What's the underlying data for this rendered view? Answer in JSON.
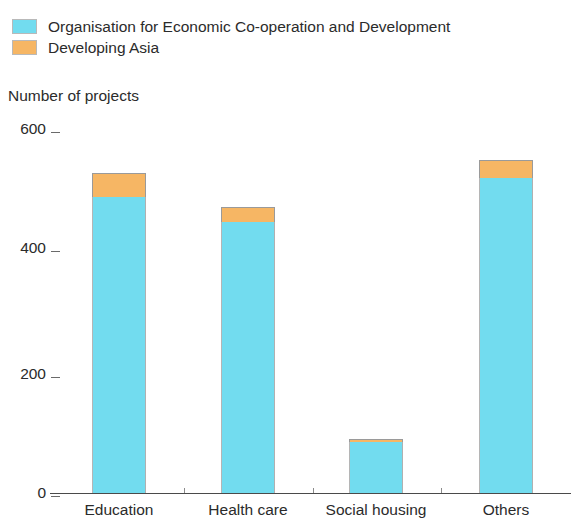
{
  "legend": {
    "items": [
      {
        "label": "Organisation for Economic Co-operation and Development",
        "color": "#72dcef",
        "key": "oecd"
      },
      {
        "label": "Developing Asia",
        "color": "#f6b664",
        "key": "asia"
      }
    ]
  },
  "axis": {
    "y_title": "Number of projects",
    "y_ticks": [
      "600",
      "400",
      "200",
      "0"
    ],
    "x_labels": [
      "Education",
      "Health care",
      "Social housing",
      "Others"
    ]
  },
  "chart_data": {
    "type": "bar",
    "stacked": true,
    "title": "",
    "subtitle": "",
    "xlabel": "",
    "ylabel": "Number of projects",
    "ylim": [
      0,
      600
    ],
    "yticks": [
      0,
      200,
      400,
      600
    ],
    "grid": false,
    "legend_position": "top-left",
    "categories": [
      "Education",
      "Health care",
      "Social housing",
      "Others"
    ],
    "series": [
      {
        "name": "Organisation for Economic Co-operation and Development",
        "color": "#72dcef",
        "values": [
          487,
          446,
          84,
          518
        ]
      },
      {
        "name": "Developing Asia",
        "color": "#f6b664",
        "values": [
          39,
          24,
          5,
          30
        ]
      }
    ],
    "totals": [
      526,
      470,
      89,
      548
    ]
  }
}
